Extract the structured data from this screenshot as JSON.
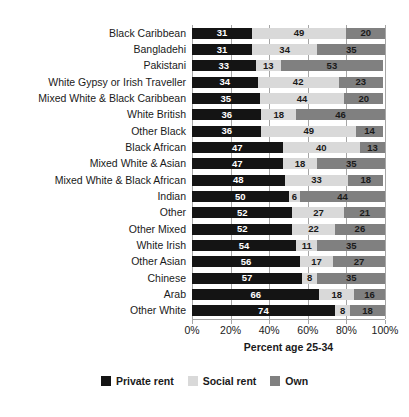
{
  "chart_data": {
    "type": "bar",
    "subtype": "horizontal-stacked-100",
    "title": "",
    "xlabel": "Percent age 25-34",
    "ylabel": "",
    "xlim": [
      0,
      100
    ],
    "xticks": [
      "0%",
      "20%",
      "40%",
      "60%",
      "80%",
      "100%"
    ],
    "xtick_values": [
      0,
      20,
      40,
      60,
      80,
      100
    ],
    "grid": true,
    "grid_axis": "x",
    "legend_position": "bottom",
    "categories": [
      "Black Caribbean",
      "Bangladehi",
      "Pakistani",
      "White Gypsy or Irish Traveller",
      "Mixed White & Black Caribbean",
      "White British",
      "Other Black",
      "Black African",
      "Mixed White & Asian",
      "Mixed White & Black African",
      "Indian",
      "Other",
      "Other Mixed",
      "White Irish",
      "Other Asian",
      "Chinese",
      "Arab",
      "Other White"
    ],
    "series": [
      {
        "name": "Private rent",
        "color": "#141414",
        "values": [
          31,
          31,
          33,
          34,
          35,
          36,
          36,
          47,
          47,
          48,
          50,
          52,
          52,
          54,
          56,
          57,
          66,
          74
        ]
      },
      {
        "name": "Social rent",
        "color": "#d9d9d9",
        "values": [
          49,
          34,
          13,
          42,
          44,
          18,
          49,
          40,
          18,
          33,
          6,
          27,
          22,
          11,
          17,
          8,
          18,
          8
        ]
      },
      {
        "name": "Own",
        "color": "#808080",
        "values": [
          20,
          35,
          53,
          23,
          20,
          46,
          14,
          13,
          35,
          18,
          44,
          21,
          26,
          35,
          27,
          35,
          16,
          18
        ]
      }
    ]
  },
  "legend": {
    "items": [
      {
        "label": "Private rent",
        "key": "private"
      },
      {
        "label": "Social rent",
        "key": "social"
      },
      {
        "label": "Own",
        "key": "own"
      }
    ]
  },
  "axis": {
    "x_title": "Percent age 25-34"
  },
  "colors": {
    "private_rent": "#141414",
    "social_rent": "#d9d9d9",
    "own": "#808080",
    "gridline": "#a6a6a6",
    "text": "#1a1a1a",
    "background": "#ffffff"
  }
}
